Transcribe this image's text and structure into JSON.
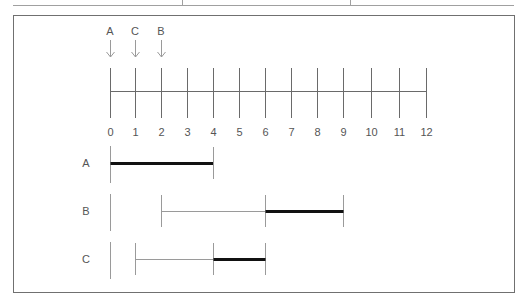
{
  "table_fragment": {
    "line_color": "#9a9a9a",
    "dividers_x": [
      182,
      350
    ]
  },
  "diagram": {
    "frame_color": "#6f6f6f",
    "markers": [
      {
        "label": "A",
        "value": 0
      },
      {
        "label": "C",
        "value": 1
      },
      {
        "label": "B",
        "value": 2
      }
    ],
    "axis": {
      "ticks": [
        "0",
        "1",
        "2",
        "3",
        "4",
        "5",
        "6",
        "7",
        "8",
        "9",
        "10",
        "11",
        "12"
      ],
      "min": 0,
      "max": 12
    },
    "rows": [
      {
        "label": "A",
        "start": 0,
        "thin_end": 0,
        "thick_start": 0,
        "thick_end": 4
      },
      {
        "label": "B",
        "start": 2,
        "thin_end": 6,
        "thick_start": 6,
        "thick_end": 9
      },
      {
        "label": "C",
        "start": 1,
        "thin_end": 4,
        "thick_start": 4,
        "thick_end": 6
      }
    ],
    "colors": {
      "text": "#555555",
      "thin_line": "#9a9a9a",
      "axis_line": "#6a6a6a",
      "thick_line": "#111111"
    }
  }
}
